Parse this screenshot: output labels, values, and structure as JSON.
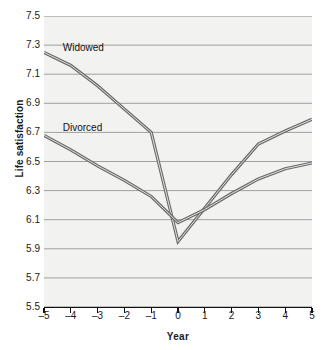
{
  "chart_data": {
    "type": "line",
    "title": "",
    "xlabel": "Year",
    "ylabel": "Life satisfaction",
    "xlim": [
      -5,
      5
    ],
    "ylim": [
      5.5,
      7.5
    ],
    "grid": true,
    "legend_position": "inline-annotations",
    "x": [
      -5,
      -4,
      -3,
      -2,
      -1,
      0,
      1,
      2,
      3,
      4,
      5
    ],
    "xticklabels": [
      "–5",
      "–4",
      "–3",
      "–2",
      "–1",
      "0",
      "1",
      "2",
      "3",
      "4",
      "5"
    ],
    "yticklabels": [
      "5.5",
      "5.7",
      "5.9",
      "6.1",
      "6.3",
      "6.5",
      "6.7",
      "6.9",
      "7.1",
      "7.3",
      "7.5"
    ],
    "yticks": [
      5.5,
      5.7,
      5.9,
      6.1,
      6.3,
      6.5,
      6.7,
      6.9,
      7.1,
      7.3,
      7.5
    ],
    "series": [
      {
        "name": "Widowed",
        "color": "#6b6b6b",
        "values": [
          7.25,
          7.16,
          7.02,
          6.86,
          6.7,
          5.95,
          6.18,
          6.41,
          6.62,
          6.71,
          6.79
        ],
        "label_x": -4.45,
        "label_y": 7.28
      },
      {
        "name": "Divorced",
        "color": "#6b6b6b",
        "values": [
          6.68,
          6.58,
          6.47,
          6.37,
          6.26,
          6.08,
          6.17,
          6.28,
          6.38,
          6.45,
          6.49
        ],
        "label_x": -4.45,
        "label_y": 6.73
      }
    ]
  },
  "style": {
    "plot_background": "#f2f2f0",
    "grid_color": "#8a8a8a",
    "axis_color": "#111111",
    "line_color": "#6b6b6b",
    "text_color": "#1a1a1a"
  }
}
